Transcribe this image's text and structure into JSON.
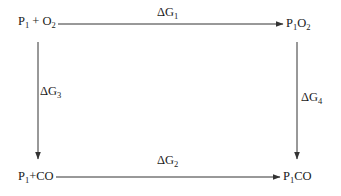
{
  "diagram": {
    "type": "thermodynamic-cycle",
    "nodes": {
      "top_left": {
        "base": "P",
        "sub1": "1",
        "mid": " + O",
        "sub2": "2"
      },
      "top_right": {
        "base": "P",
        "sub1": "1",
        "mid": "O",
        "sub2": "2"
      },
      "bottom_left": {
        "base": "P",
        "sub1": "1",
        "mid": "+CO",
        "sub2": ""
      },
      "bottom_right": {
        "base": "P",
        "sub1": "1",
        "mid": "CO",
        "sub2": ""
      }
    },
    "edges": {
      "top": {
        "symbol": "ΔG",
        "sub": "1",
        "from": "P1 + O2",
        "to": "P1O2"
      },
      "bottom": {
        "symbol": "ΔG",
        "sub": "2",
        "from": "P1+CO",
        "to": "P1CO"
      },
      "left": {
        "symbol": "ΔG",
        "sub": "3",
        "from": "P1 + O2",
        "to": "P1+CO"
      },
      "right": {
        "symbol": "ΔG",
        "sub": "4",
        "from": "P1O2",
        "to": "P1CO"
      }
    },
    "colors": {
      "line": "#333333",
      "text": "#1a1a1a",
      "background": "#ffffff"
    }
  }
}
